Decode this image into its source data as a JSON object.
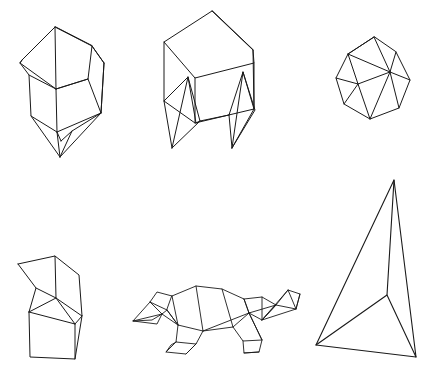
{
  "page": {
    "background_color": "#ffffff",
    "stroke_color": "#1a1a1a",
    "width": 427,
    "height": 382,
    "figure_count": 6,
    "layout": "2 rows x 3 columns of line-drawn 3D wireframe objects"
  },
  "figures": [
    {
      "id": "crystal-gem",
      "name": "faceted-crystal-polyhedron",
      "row": 1,
      "column": 1,
      "description": "Elongated faceted gem / crystal with pointed bottom apex",
      "stroke_width": 1.0,
      "bbox": [
        14,
        18,
        112,
        162
      ],
      "polylines": [
        "M 55 27 L 22 60 L 20 63 L 56 89 L 88 79 L 92 46 Z",
        "M 55 27 L 92 46",
        "M 92 46 L 104 63 L 101 113 L 72 131 L 61 141",
        "M 22 60 L 20 63",
        "M 20 63 L 29 75 L 31 116 L 57 132 L 61 141",
        "M 56 89 L 57 132",
        "M 56 89 L 88 79",
        "M 88 79 L 101 113",
        "M 57 132 L 101 113",
        "M 29 75 L 56 89",
        "M 92 46 L 104 63",
        "M 55 27 L 56 89",
        "M 31 116 L 60 157",
        "M 57 132 L 60 157",
        "M 60 157 L 101 113",
        "M 60 157 L 72 131",
        "M 104 63 L 101 113"
      ]
    },
    {
      "id": "cube-table",
      "name": "cube-with-pointed-legs",
      "row": 1,
      "column": 2,
      "description": "Cube / box body supported by four zig-zag pointed legs, like a stool",
      "stroke_width": 1.0,
      "bbox": [
        160,
        8,
        115,
        148
      ],
      "polylines": [
        "M 212 11 L 164 42 L 164 101 L 195 123 L 254 109 L 253 50 Z",
        "M 212 11 L 253 50",
        "M 164 42 L 195 78 L 254 63 L 253 50",
        "M 195 78 L 195 123",
        "M 254 63 L 254 109",
        "M 164 101 L 188 77 L 196 123",
        "M 188 77 L 200 121 L 172 148",
        "M 164 101 L 172 148",
        "M 188 77 L 172 148",
        "M 196 123 L 200 121",
        "M 200 121 L 229 115",
        "M 229 115 L 243 72 L 254 109",
        "M 243 72 L 255 110 L 232 148",
        "M 229 115 L 232 148",
        "M 243 72 L 232 148",
        "M 254 109 L 232 148"
      ]
    },
    {
      "id": "hexa-disc",
      "name": "faceted-heptagonal-disc",
      "row": 1,
      "column": 3,
      "description": "Compact rounded polyhedron with heptagonal silhouette and internal triangulation",
      "stroke_width": 1.0,
      "bbox": [
        332,
        30,
        82,
        95
      ],
      "polylines": [
        "M 374 37 L 348 54 L 336 78 L 344 104 L 370 119 L 399 108 L 410 80 L 396 52 Z",
        "M 374 37 L 390 72 L 399 108",
        "M 348 54 L 358 84 L 344 104",
        "M 390 72 L 396 52",
        "M 390 72 L 410 80",
        "M 358 84 L 390 72",
        "M 348 54 L 390 72",
        "M 336 78 L 358 84",
        "M 358 84 L 370 119",
        "M 374 37 L 348 54",
        "M 390 72 L 370 119"
      ]
    },
    {
      "id": "bent-prism",
      "name": "bent-chevron-prism",
      "row": 2,
      "column": 1,
      "description": "Box prism whose top is folded into a chevron / zig-zag notch",
      "stroke_width": 1.0,
      "bbox": [
        14,
        252,
        86,
        108
      ],
      "polylines": [
        "M 18 264 L 55 256 L 56 298 L 29 312",
        "M 18 264 L 36 288 L 29 312",
        "M 55 256 L 79 275 L 82 316 L 56 298",
        "M 29 312 L 30 357 L 75 359 L 82 316",
        "M 29 312 L 75 324 L 75 359",
        "M 75 324 L 82 316",
        "M 56 298 L 75 324",
        "M 36 288 L 56 298"
      ]
    },
    {
      "id": "turtle",
      "name": "low-poly-turtle",
      "row": 2,
      "column": 2,
      "description": "Low polygon wireframe turtle/tortoise facing right with shell, head, tail and four legs",
      "stroke_width": 0.9,
      "polylines": [
        "M 172 296 L 196 286 L 222 289 L 244 299 L 249 313 L 233 327 L 203 331 L 178 325 L 167 310 Z",
        "M 167 310 L 150 302 L 157 292 L 172 296",
        "M 150 302 L 162 314 L 167 310",
        "M 150 302 L 133 321 L 162 314",
        "M 133 321 L 152 320 L 162 314",
        "M 133 321 L 157 324 L 162 314",
        "M 178 325 L 176 342 L 196 344 L 203 331",
        "M 176 342 L 166 352 L 186 354 L 196 344",
        "M 166 352 L 171 345 L 176 342",
        "M 186 354 L 196 344",
        "M 233 327 L 243 341 L 262 340 L 249 313",
        "M 243 341 L 244 353 L 259 352 L 262 340",
        "M 244 353 L 259 352",
        "M 249 313 L 262 340",
        "M 244 299 L 262 297 L 276 305 L 262 320 L 249 313",
        "M 262 297 L 262 320",
        "M 276 305 L 288 290 L 300 294 L 296 309 L 276 305",
        "M 288 290 L 296 309",
        "M 300 294 L 296 309",
        "M 262 320 L 276 305",
        "M 262 320 L 288 290",
        "M 262 320 L 296 309",
        "M 249 313 L 276 305",
        "M 222 289 L 233 327",
        "M 196 286 L 203 331",
        "M 172 296 L 178 325",
        "M 244 299 L 249 313",
        "M 203 331 L 249 313",
        "M 167 310 L 178 325",
        "M 162 314 L 178 325"
      ]
    },
    {
      "id": "tetrahedron",
      "name": "tetrahedron",
      "row": 2,
      "column": 3,
      "description": "Large tetrahedron with apex at top right, two base vertices bottom, and one visible interior edge junction",
      "stroke_width": 1.1,
      "bbox": [
        314,
        178,
        103,
        181
      ],
      "vertices": {
        "apex": [
          394,
          180
        ],
        "left_base": [
          316,
          345
        ],
        "right_base": [
          416,
          357
        ],
        "interior": [
          387,
          295
        ]
      },
      "polylines": [
        "M 394 180 L 316 345 L 416 357 Z",
        "M 394 180 L 387 295 L 416 357",
        "M 387 295 L 316 345"
      ]
    }
  ]
}
